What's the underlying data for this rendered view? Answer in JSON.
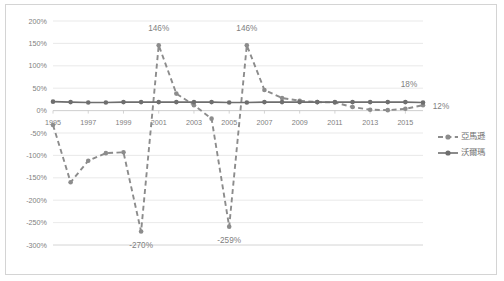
{
  "chart_data": {
    "type": "line",
    "title": "",
    "xlabel": "",
    "ylabel": "",
    "ylim": [
      -300,
      200
    ],
    "ytick_step": 50,
    "grid": true,
    "legend_position": "right",
    "yticks": [
      "200%",
      "150%",
      "100%",
      "50%",
      "0%",
      "-50%",
      "-100%",
      "-150%",
      "-200%",
      "-250%",
      "-300%"
    ],
    "ytick_values": [
      200,
      150,
      100,
      50,
      0,
      -50,
      -100,
      -150,
      -200,
      -250,
      -300
    ],
    "x": [
      1995,
      1996,
      1997,
      1998,
      1999,
      2000,
      2001,
      2002,
      2003,
      2004,
      2005,
      2006,
      2007,
      2008,
      2009,
      2010,
      2011,
      2012,
      2013,
      2014,
      2015,
      2016
    ],
    "xticks": [
      "1995",
      "1997",
      "1999",
      "2001",
      "2003",
      "2005",
      "2007",
      "2009",
      "2011",
      "2013",
      "2015"
    ],
    "xtick_values": [
      1995,
      1997,
      1999,
      2001,
      2003,
      2005,
      2007,
      2009,
      2011,
      2013,
      2015
    ],
    "series": [
      {
        "name": "亞馬遜",
        "style": "dashed",
        "color": "#8c8c8c",
        "values": [
          -32,
          -160,
          -112,
          -95,
          -93,
          -270,
          146,
          38,
          12,
          -18,
          -259,
          146,
          46,
          28,
          22,
          19,
          18,
          8,
          2,
          1,
          4,
          12
        ]
      },
      {
        "name": "沃爾瑪",
        "style": "solid",
        "color": "#6e6e6e",
        "values": [
          20,
          19,
          18,
          18,
          19,
          19,
          19,
          19,
          19,
          19,
          18,
          18,
          19,
          19,
          19,
          19,
          19,
          19,
          19,
          19,
          19,
          18
        ]
      }
    ],
    "annotations": [
      {
        "text": "146%",
        "x": 2001,
        "y": 146,
        "dx": 0,
        "dy": -14
      },
      {
        "text": "146%",
        "x": 2006,
        "y": 146,
        "dx": 0,
        "dy": -14
      },
      {
        "text": "-270%",
        "x": 2000,
        "y": -270,
        "dx": 0,
        "dy": 16
      },
      {
        "text": "-259%",
        "x": 2005,
        "y": -259,
        "dx": 0,
        "dy": 16
      },
      {
        "text": "18%",
        "x": 2016,
        "y": 18,
        "dx": -14,
        "dy": -16
      },
      {
        "text": "12%",
        "x": 2016,
        "y": 12,
        "dx": 18,
        "dy": 4
      }
    ]
  },
  "legend": {
    "items": [
      {
        "label": "亞馬遜",
        "style": "dashed"
      },
      {
        "label": "沃爾瑪",
        "style": "solid"
      }
    ]
  }
}
